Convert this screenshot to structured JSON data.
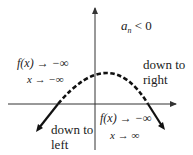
{
  "diagram": {
    "condition": {
      "base": "a",
      "subscript": "n",
      "relation": "< 0"
    },
    "left_limit": {
      "function_expr": "f(x) → −∞",
      "variable_expr": "x → −∞"
    },
    "right_limit": {
      "function_expr": "f(x) → −∞",
      "variable_expr": "x → ∞"
    },
    "left_label": {
      "line1": "down to",
      "line2": "left"
    },
    "right_label": {
      "line1": "down to",
      "line2": "right"
    },
    "colors": {
      "axis": "#333333",
      "curve": "#111111",
      "text": "#222222",
      "background": "#ffffff"
    },
    "curve": {
      "shape": "downward-opening parabola",
      "dashed_middle": true,
      "solid_ends": true
    }
  }
}
